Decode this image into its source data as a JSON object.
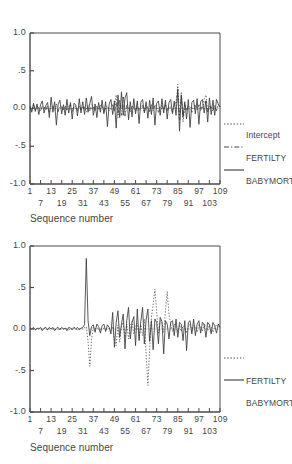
{
  "figure": {
    "background": "#ffffff",
    "line_color": "#3c3c3c"
  },
  "charts": [
    {
      "id": "chart-1",
      "xlabel": "Sequence number",
      "yticks": [
        "1.0",
        ".5",
        "0.0",
        "-.5",
        "-1.0"
      ],
      "ytick_values": [
        1.0,
        0.5,
        0.0,
        -0.5,
        -1.0
      ],
      "xticks_top": [
        "1",
        "13",
        "25",
        "37",
        "49",
        "61",
        "73",
        "85",
        "97",
        "109"
      ],
      "xticks_bottom": [
        "7",
        "19",
        "31",
        "43",
        "55",
        "67",
        "79",
        "91",
        "103"
      ],
      "legend": [
        {
          "label": "Intercept",
          "style": "dotted"
        },
        {
          "label": "FERTILTY",
          "style": "dashdot"
        },
        {
          "label": "BABYMORT",
          "style": "solid"
        }
      ]
    },
    {
      "id": "chart-2",
      "xlabel": "Sequence number",
      "yticks": [
        "1.0",
        ".5",
        "0.0",
        "-.5",
        "-1.0"
      ],
      "ytick_values": [
        1.0,
        0.5,
        0.0,
        -0.5,
        -1.0
      ],
      "xticks_top": [
        "1",
        "13",
        "25",
        "37",
        "49",
        "61",
        "73",
        "85",
        "97",
        "109"
      ],
      "xticks_bottom": [
        "7",
        "19",
        "31",
        "43",
        "55",
        "67",
        "79",
        "91",
        "103"
      ],
      "legend": [
        {
          "label": "FERTILTY",
          "style": "dotted"
        },
        {
          "label": "BABYMORT",
          "style": "solid"
        }
      ]
    }
  ],
  "chart_data": [
    {
      "type": "line",
      "title": "",
      "xlabel": "Sequence number",
      "ylabel": "",
      "xlim": [
        1,
        109
      ],
      "ylim": [
        -1.0,
        1.0
      ],
      "yticks": [
        -1.0,
        -0.5,
        0.0,
        0.5,
        1.0
      ],
      "xticks": [
        1,
        7,
        13,
        19,
        25,
        31,
        37,
        43,
        49,
        55,
        61,
        67,
        73,
        79,
        85,
        91,
        97,
        103,
        109
      ],
      "grid": false,
      "legend_position": "right-outside",
      "series": [
        {
          "name": "Intercept",
          "style": "dotted",
          "values": [
            0.01,
            0.0,
            0.01,
            0.0,
            -0.01,
            0.0,
            0.01,
            0.0,
            0.0,
            0.01,
            0.0,
            -0.01,
            0.0,
            0.01,
            0.0,
            0.0,
            -0.01,
            0.0,
            0.01,
            0.0,
            0.0,
            0.01,
            0.0,
            -0.01,
            0.0,
            0.01,
            0.0,
            0.0,
            -0.01,
            0.0,
            0.01,
            0.0,
            0.0,
            0.01,
            -0.01,
            0.0,
            0.01,
            0.0,
            0.0,
            -0.01,
            0.0,
            0.01,
            0.0,
            0.0,
            0.01,
            0.0,
            -0.01,
            0.0,
            0.02,
            0.18,
            -0.12,
            0.04,
            0.0,
            0.15,
            -0.08,
            0.02,
            0.0,
            -0.01,
            0.0,
            0.01,
            0.0,
            0.0,
            -0.01,
            0.0,
            0.01,
            0.0,
            0.0,
            0.01,
            0.0,
            -0.01,
            0.0,
            0.01,
            0.0,
            0.0,
            -0.01,
            0.0,
            0.01,
            0.0,
            0.0,
            0.01,
            0.0,
            -0.01,
            0.0,
            0.01,
            0.32,
            -0.1,
            0.22,
            -0.18,
            0.03,
            0.0,
            -0.01,
            0.0,
            0.01,
            0.0,
            0.0,
            -0.01,
            0.0,
            0.01,
            0.0,
            0.12,
            0.18,
            -0.04,
            0.02,
            0.0,
            0.01,
            0.0,
            -0.01,
            0.05,
            0.02
          ]
        },
        {
          "name": "FERTILTY",
          "style": "dashdot",
          "values": [
            0.02,
            -0.03,
            0.05,
            -0.02,
            0.03,
            0.01,
            -0.04,
            0.03,
            0.02,
            -0.02,
            0.04,
            -0.05,
            0.02,
            0.03,
            -0.03,
            0.06,
            -0.04,
            0.02,
            0.03,
            -0.02,
            0.04,
            -0.03,
            0.02,
            0.05,
            -0.04,
            0.02,
            0.03,
            -0.03,
            0.04,
            -0.02,
            0.03,
            0.02,
            -0.05,
            0.04,
            -0.03,
            0.05,
            0.02,
            -0.04,
            0.03,
            -0.02,
            0.04,
            0.03,
            -0.05,
            0.02,
            0.04,
            -0.03,
            0.02,
            0.05,
            -0.04,
            0.08,
            -0.06,
            0.12,
            -0.09,
            0.15,
            -0.1,
            0.06,
            0.04,
            -0.05,
            0.03,
            0.02,
            -0.04,
            0.05,
            -0.03,
            0.02,
            0.04,
            -0.05,
            0.03,
            0.02,
            -0.04,
            0.05,
            -0.03,
            0.04,
            0.02,
            -0.05,
            0.03,
            0.04,
            -0.02,
            0.05,
            -0.04,
            0.03,
            0.02,
            -0.05,
            0.04,
            0.1,
            0.2,
            -0.15,
            0.14,
            -0.12,
            0.05,
            -0.03,
            0.04,
            0.02,
            -0.05,
            0.03,
            0.04,
            -0.02,
            0.05,
            -0.03,
            0.04,
            0.06,
            0.1,
            -0.05,
            0.03,
            0.02,
            -0.04,
            0.05,
            -0.03,
            0.04,
            0.02
          ]
        },
        {
          "name": "BABYMORT",
          "style": "solid",
          "values": [
            0.03,
            -0.05,
            0.07,
            -0.04,
            0.06,
            -0.08,
            0.05,
            0.1,
            -0.06,
            0.04,
            0.08,
            -0.12,
            0.15,
            -0.05,
            0.09,
            -0.22,
            0.06,
            0.11,
            -0.07,
            0.05,
            -0.09,
            0.12,
            -0.06,
            0.08,
            -0.14,
            0.07,
            0.05,
            -0.1,
            0.13,
            -0.06,
            0.09,
            -0.08,
            0.14,
            -0.05,
            0.07,
            0.16,
            -0.09,
            0.06,
            -0.12,
            0.08,
            -0.05,
            0.11,
            -0.07,
            0.09,
            -0.24,
            0.06,
            0.12,
            -0.08,
            0.1,
            -0.26,
            0.18,
            -0.12,
            0.22,
            -0.09,
            0.14,
            0.21,
            -0.15,
            0.09,
            -0.11,
            0.13,
            -0.07,
            0.1,
            -0.2,
            0.08,
            0.12,
            -0.06,
            0.09,
            -0.13,
            0.11,
            -0.08,
            0.14,
            -0.22,
            0.07,
            0.1,
            -0.09,
            0.13,
            -0.06,
            0.11,
            -0.14,
            0.08,
            0.12,
            -0.07,
            0.1,
            -0.09,
            0.26,
            -0.3,
            0.18,
            -0.11,
            0.09,
            -0.14,
            0.12,
            -0.25,
            0.08,
            0.11,
            -0.07,
            0.13,
            -0.21,
            0.09,
            0.12,
            -0.06,
            0.1,
            -0.18,
            0.14,
            -0.08,
            0.11,
            -0.09,
            0.12,
            0.06,
            0.02
          ]
        }
      ]
    },
    {
      "type": "line",
      "title": "",
      "xlabel": "Sequence number",
      "ylabel": "",
      "xlim": [
        1,
        109
      ],
      "ylim": [
        -1.0,
        1.0
      ],
      "yticks": [
        -1.0,
        -0.5,
        0.0,
        0.5,
        1.0
      ],
      "xticks": [
        1,
        7,
        13,
        19,
        25,
        31,
        37,
        43,
        49,
        55,
        61,
        67,
        73,
        79,
        85,
        91,
        97,
        103,
        109
      ],
      "grid": false,
      "legend_position": "right-outside",
      "series": [
        {
          "name": "FERTILTY",
          "style": "dotted",
          "values": [
            0.0,
            0.01,
            0.0,
            -0.01,
            0.0,
            0.01,
            0.0,
            0.0,
            0.01,
            0.0,
            -0.01,
            0.0,
            0.01,
            0.0,
            0.0,
            -0.01,
            0.0,
            0.01,
            0.0,
            0.0,
            0.01,
            0.0,
            -0.01,
            0.0,
            0.01,
            0.02,
            0.0,
            -0.01,
            0.0,
            0.01,
            0.0,
            0.02,
            0.03,
            -0.15,
            -0.45,
            -0.12,
            0.02,
            0.0,
            0.01,
            0.0,
            -0.01,
            0.0,
            0.01,
            0.0,
            0.0,
            0.01,
            -0.02,
            0.03,
            -0.14,
            -0.2,
            0.05,
            -0.16,
            0.03,
            0.08,
            -0.1,
            0.06,
            -0.12,
            0.04,
            0.09,
            -0.06,
            0.03,
            0.07,
            -0.11,
            0.05,
            -0.08,
            0.12,
            -0.3,
            -0.68,
            -0.25,
            0.14,
            0.3,
            0.48,
            0.2,
            -0.05,
            0.1,
            0.08,
            -0.04,
            0.22,
            0.45,
            0.18,
            0.05,
            -0.03,
            0.06,
            0.02,
            -0.04,
            0.05,
            -0.03,
            0.04,
            0.02,
            -0.05,
            0.03,
            0.06,
            -0.02,
            0.04,
            0.03,
            -0.04,
            0.05,
            0.02,
            -0.03,
            0.06,
            0.04,
            -0.02,
            0.05,
            0.03,
            -0.04,
            0.02,
            0.05,
            0.03,
            0.01
          ]
        },
        {
          "name": "BABYMORT",
          "style": "solid",
          "values": [
            0.01,
            0.0,
            0.02,
            -0.01,
            0.01,
            0.0,
            0.02,
            -0.02,
            0.01,
            0.02,
            -0.01,
            0.02,
            0.0,
            0.02,
            -0.02,
            0.01,
            0.02,
            -0.01,
            0.02,
            0.0,
            0.01,
            -0.02,
            0.02,
            0.01,
            -0.01,
            0.02,
            0.0,
            0.02,
            -0.01,
            0.01,
            0.02,
            0.05,
            0.85,
            0.1,
            -0.08,
            0.03,
            0.05,
            -0.04,
            0.06,
            0.03,
            -0.05,
            0.04,
            0.06,
            -0.03,
            0.05,
            0.02,
            -0.06,
            0.2,
            -0.22,
            0.08,
            0.22,
            -0.1,
            0.06,
            0.18,
            -0.24,
            0.1,
            0.26,
            -0.12,
            0.08,
            0.15,
            -0.2,
            0.24,
            -0.14,
            0.09,
            0.26,
            -0.18,
            0.11,
            0.24,
            -0.15,
            0.1,
            -0.25,
            0.12,
            0.08,
            -0.18,
            0.14,
            0.09,
            -0.3,
            0.1,
            0.06,
            -0.12,
            0.08,
            0.1,
            -0.08,
            0.12,
            -0.1,
            0.08,
            0.06,
            -0.14,
            0.1,
            -0.26,
            0.08,
            0.1,
            -0.06,
            0.12,
            -0.08,
            0.06,
            0.1,
            -0.05,
            0.08,
            0.06,
            -0.1,
            0.08,
            0.05,
            -0.06,
            0.08,
            0.04,
            -0.05,
            0.06,
            0.02
          ]
        }
      ]
    }
  ]
}
